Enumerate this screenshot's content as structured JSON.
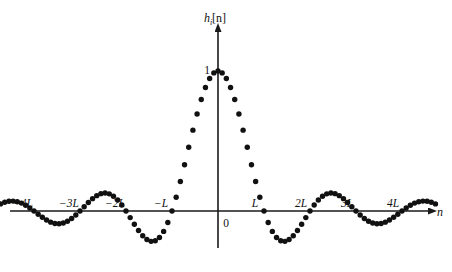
{
  "figure": {
    "y_axis_label": "hᵢ[n]",
    "y_axis_label_parts": {
      "base": "h",
      "sub": "i",
      "bracket": "[n]"
    },
    "x_axis_label": "n",
    "peak_label": "1",
    "origin_label": "0",
    "x_tick_labels": [
      "−4L",
      "−3L",
      "−2L",
      "−L",
      "L",
      "2L",
      "3L",
      "4L"
    ],
    "dot_color": "#111111",
    "axis_color": "#1a1a1a",
    "background": "#ffffff"
  },
  "chart_data": {
    "type": "scatter",
    "title": "",
    "xlabel": "n",
    "ylabel": "hᵢ[n]",
    "grid": false,
    "legend": null,
    "xlim": [
      -4.8,
      4.8
    ],
    "ylim": [
      -0.25,
      1.08
    ],
    "x_unit": "L",
    "x_ticks": [
      -4,
      -3,
      -2,
      -1,
      1,
      2,
      3,
      4
    ],
    "x_tick_labels": [
      "−4L",
      "−3L",
      "−2L",
      "−L",
      "L",
      "2L",
      "3L",
      "4L"
    ],
    "y_ticks": [
      0,
      1
    ],
    "y_tick_labels": [
      "0",
      "1"
    ],
    "samples_per_L": 11,
    "sample_x_over_L": [
      -4.7273,
      -4.6364,
      -4.5455,
      -4.4545,
      -4.3636,
      -4.2727,
      -4.1818,
      -4.0909,
      -4.0,
      -3.9091,
      -3.8182,
      -3.7273,
      -3.6364,
      -3.5455,
      -3.4545,
      -3.3636,
      -3.2727,
      -3.1818,
      -3.0909,
      -3.0,
      -2.9091,
      -2.8182,
      -2.7273,
      -2.6364,
      -2.5455,
      -2.4545,
      -2.3636,
      -2.2727,
      -2.1818,
      -2.0909,
      -2.0,
      -1.9091,
      -1.8182,
      -1.7273,
      -1.6364,
      -1.5455,
      -1.4545,
      -1.3636,
      -1.2727,
      -1.1818,
      -1.0909,
      -1.0,
      -0.9091,
      -0.8182,
      -0.7273,
      -0.6364,
      -0.5455,
      -0.4545,
      -0.3636,
      -0.2727,
      -0.1818,
      -0.0909,
      0.0,
      0.0909,
      0.1818,
      0.2727,
      0.3636,
      0.4545,
      0.5455,
      0.6364,
      0.7273,
      0.8182,
      0.9091,
      1.0,
      1.0909,
      1.1818,
      1.2727,
      1.3636,
      1.4545,
      1.5455,
      1.6364,
      1.7273,
      1.8182,
      1.9091,
      2.0,
      2.0909,
      2.1818,
      2.2727,
      2.3636,
      2.4545,
      2.5455,
      2.6364,
      2.7273,
      2.8182,
      2.9091,
      3.0,
      3.0909,
      3.1818,
      3.2727,
      3.3636,
      3.4545,
      3.5455,
      3.6364,
      3.7273,
      3.8182,
      3.9091,
      4.0,
      4.0909,
      4.1818,
      4.2727,
      4.3636,
      4.4545,
      4.5455,
      4.6364,
      4.7273
    ],
    "values_note": "y = sin(pi*x)/(pi*x) with x in units of L; computed in the renderer from sample_x_over_L",
    "sample_y": [
      -0.0589,
      -0.0779,
      -0.0856,
      -0.0813,
      -0.0657,
      -0.0407,
      -0.0094,
      0.0242,
      0.0,
      0.058,
      0.0819,
      0.0954,
      0.0969,
      0.0862,
      0.0645,
      0.0345,
      0.0,
      -0.0345,
      -0.0645,
      0.0,
      -0.1069,
      -0.1246,
      -0.1254,
      -0.1082,
      -0.0755,
      -0.032,
      0.016,
      0.0621,
      0.1,
      0.1248,
      0.0,
      0.157,
      0.1325,
      0.0888,
      0.0307,
      -0.0347,
      -0.0989,
      -0.1534,
      -0.1908,
      -0.2058,
      -0.196,
      0.0,
      0.104,
      0.2157,
      0.3383,
      0.4685,
      0.6022,
      0.7346,
      0.8605,
      0.9745,
      0.9874,
      0.9866,
      1.0,
      0.9866,
      0.9874,
      0.9745,
      0.8605,
      0.7346,
      0.6022,
      0.4685,
      0.3383,
      0.2157,
      0.104,
      0.0,
      -0.196,
      -0.2058,
      -0.1908,
      -0.1534,
      -0.0989,
      -0.0347,
      0.0307,
      0.0888,
      0.1325,
      0.157,
      0.0,
      0.1248,
      0.1,
      0.0621,
      0.016,
      -0.032,
      -0.0755,
      -0.1082,
      -0.1254,
      -0.1246,
      -0.1069,
      0.0,
      -0.0645,
      -0.0345,
      0.0,
      0.0345,
      0.0645,
      0.0862,
      0.0969,
      0.0954,
      0.0819,
      0.058,
      0.0,
      0.0242,
      -0.0094,
      -0.0407,
      -0.0657,
      -0.0813,
      -0.0856,
      -0.0779,
      -0.0589
    ]
  },
  "geometry": {
    "origin_x": 218,
    "origin_y": 211,
    "unit_L_px": 46,
    "unit_y_px": 140,
    "x_axis_start": 10,
    "x_axis_end": 428,
    "y_axis_top": 32,
    "y_axis_bottom": 248,
    "dot_radius": 2.7
  }
}
